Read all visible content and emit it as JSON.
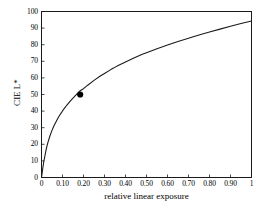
{
  "chart_data": {
    "type": "line",
    "title": "",
    "xlabel": "relative linear exposure",
    "ylabel": "CIE L*",
    "xlim": [
      0,
      1
    ],
    "ylim": [
      0,
      100
    ],
    "grid": false,
    "legend": null,
    "xticks": [
      0,
      0.1,
      0.2,
      0.3,
      0.4,
      0.5,
      0.6,
      0.7,
      0.8,
      0.9,
      1
    ],
    "xticklabels": [
      "0",
      "0.10",
      "0.20",
      "0.30",
      "0.40",
      "0.50",
      "0.60",
      "0.70",
      "0.80",
      "0.90",
      "1"
    ],
    "yticks": [
      0,
      10,
      20,
      30,
      40,
      50,
      60,
      70,
      80,
      90,
      100
    ],
    "yticklabels": [
      "0",
      "10",
      "20",
      "30",
      "40",
      "50",
      "60",
      "70",
      "80",
      "90",
      "100"
    ],
    "line_color": "#1a1a1a",
    "series": [
      {
        "name": "CIE L* lightness",
        "x": [
          0,
          0.002,
          0.004,
          0.006,
          0.008856,
          0.012,
          0.016,
          0.02,
          0.025,
          0.03,
          0.04,
          0.05,
          0.06,
          0.07,
          0.08,
          0.09,
          0.1,
          0.12,
          0.14,
          0.16,
          0.1842,
          0.2,
          0.22,
          0.25,
          0.28,
          0.3,
          0.33,
          0.36,
          0.4,
          0.44,
          0.48,
          0.5,
          0.55,
          0.6,
          0.65,
          0.7,
          0.75,
          0.8,
          0.85,
          0.9,
          0.95,
          1
        ],
        "y": [
          0,
          1.81,
          3.61,
          5.42,
          8.0,
          10.4,
          12.8,
          15.5,
          18.4,
          20.9,
          25.0,
          28.4,
          31.3,
          33.8,
          36.1,
          38.2,
          40.1,
          43.5,
          46.5,
          49.1,
          52.3,
          53.5,
          55.6,
          58.5,
          61.1,
          62.7,
          65.0,
          67.1,
          69.6,
          72.0,
          74.2,
          75.2,
          77.6,
          79.8,
          81.9,
          83.9,
          85.8,
          87.6,
          89.4,
          91.1,
          92.8,
          94.3
        ]
      }
    ],
    "markers": [
      {
        "name": "mid-gray-point",
        "x": 0.1842,
        "y": 50,
        "shape": "filled-circle",
        "color": "#000000",
        "label": ""
      }
    ]
  },
  "axes": {
    "y_tick_labels": [
      "100",
      "90",
      "80",
      "70",
      "60",
      "50",
      "40",
      "30",
      "20",
      "10",
      "0"
    ],
    "x_tick_labels": [
      "0",
      "0.10",
      "0.20",
      "0.30",
      "0.40",
      "0.50",
      "0.60",
      "0.70",
      "0.80",
      "0.90",
      "1"
    ],
    "x_title": "relative linear exposure",
    "y_title": "CIE L*"
  }
}
